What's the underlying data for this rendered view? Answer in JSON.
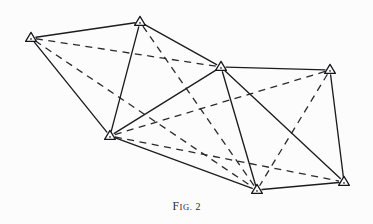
{
  "figure": {
    "caption_prefix_first": "F",
    "caption_prefix_rest": "IG.",
    "caption_number": "2",
    "caption_full": "FIG. 2",
    "background_color": "#fcfcfd",
    "ink_color": "#1d1d1f",
    "width": 373,
    "height": 224
  },
  "chart_data": {
    "type": "diagram",
    "subtitle": "",
    "marker_style": "open-triangle-with-center-dot",
    "coordinate_space": {
      "x_range": [
        0,
        373
      ],
      "y_range": [
        0,
        224
      ],
      "origin": "top-left"
    },
    "nodes": [
      {
        "id": "A",
        "label": "A",
        "x": 31,
        "y": 38
      },
      {
        "id": "B",
        "label": "B",
        "x": 140,
        "y": 22
      },
      {
        "id": "C",
        "label": "C",
        "x": 110,
        "y": 136
      },
      {
        "id": "D",
        "label": "D",
        "x": 221,
        "y": 67
      },
      {
        "id": "E",
        "label": "E",
        "x": 330,
        "y": 70
      },
      {
        "id": "F",
        "label": "F",
        "x": 257,
        "y": 190
      },
      {
        "id": "G",
        "label": "G",
        "x": 344,
        "y": 182
      }
    ],
    "edges": [
      {
        "from": "A",
        "to": "B",
        "style": "solid"
      },
      {
        "from": "A",
        "to": "C",
        "style": "solid"
      },
      {
        "from": "B",
        "to": "C",
        "style": "solid"
      },
      {
        "from": "B",
        "to": "D",
        "style": "solid"
      },
      {
        "from": "C",
        "to": "D",
        "style": "solid"
      },
      {
        "from": "C",
        "to": "F",
        "style": "solid"
      },
      {
        "from": "D",
        "to": "E",
        "style": "solid"
      },
      {
        "from": "D",
        "to": "F",
        "style": "solid"
      },
      {
        "from": "D",
        "to": "G",
        "style": "solid"
      },
      {
        "from": "E",
        "to": "G",
        "style": "solid"
      },
      {
        "from": "F",
        "to": "G",
        "style": "solid"
      },
      {
        "from": "A",
        "to": "D",
        "style": "dashed"
      },
      {
        "from": "A",
        "to": "F",
        "style": "dashed"
      },
      {
        "from": "B",
        "to": "F",
        "style": "dashed"
      },
      {
        "from": "C",
        "to": "E",
        "style": "dashed"
      },
      {
        "from": "C",
        "to": "G",
        "style": "dashed"
      },
      {
        "from": "E",
        "to": "F",
        "style": "dashed"
      }
    ],
    "legend": [],
    "grid": false
  }
}
